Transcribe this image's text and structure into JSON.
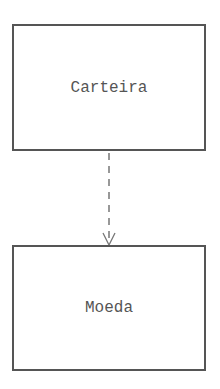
{
  "diagram": {
    "type": "dependency",
    "nodes": [
      {
        "id": "carteira",
        "label": "Carteira"
      },
      {
        "id": "moeda",
        "label": "Moeda"
      }
    ],
    "edges": [
      {
        "from": "carteira",
        "to": "moeda",
        "style": "dashed",
        "arrowhead": "open"
      }
    ],
    "colors": {
      "stroke": "#555555",
      "text": "#555555",
      "background": "#ffffff"
    }
  }
}
